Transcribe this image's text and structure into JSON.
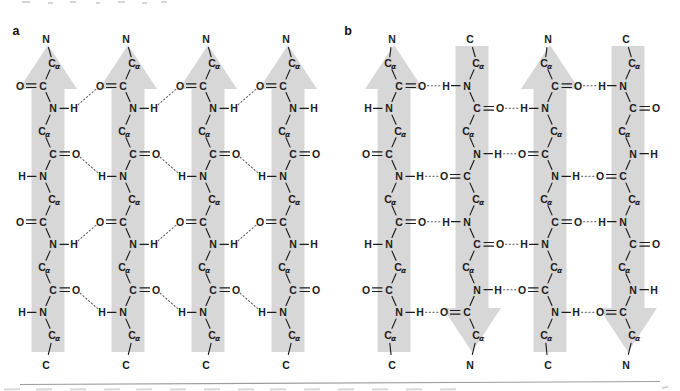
{
  "figure": {
    "alpha_subscript": "α",
    "colors": {
      "arrow": "#d7d7d7",
      "bond": "#1c1c1c",
      "text": "#1c1c1c",
      "hbond": "#5d5d5d",
      "rule": "#9c9c9c"
    },
    "panels": [
      {
        "label": "a",
        "label_x": 16,
        "strands": [
          {
            "cx": 48,
            "direction": "up",
            "top_label": "N",
            "bottom_label": "C",
            "rows": [
              "Ca",
              "C=O|L",
              "N-H|R",
              "Ca",
              "C=O|R",
              "N-H|L",
              "Ca",
              "C=O|L",
              "N-H|R",
              "Ca",
              "C=O|R",
              "N-H|L",
              "Ca"
            ]
          },
          {
            "cx": 128,
            "direction": "up",
            "top_label": "N",
            "bottom_label": "C",
            "rows": [
              "Ca",
              "C=O|L",
              "N-H|R",
              "Ca",
              "C=O|R",
              "N-H|L",
              "Ca",
              "C=O|L",
              "N-H|R",
              "Ca",
              "C=O|R",
              "N-H|L",
              "Ca"
            ]
          },
          {
            "cx": 208,
            "direction": "up",
            "top_label": "N",
            "bottom_label": "C",
            "rows": [
              "Ca",
              "C=O|L",
              "N-H|R",
              "Ca",
              "C=O|R",
              "N-H|L",
              "Ca",
              "C=O|L",
              "N-H|R",
              "Ca",
              "C=O|R",
              "N-H|L",
              "Ca"
            ]
          },
          {
            "cx": 288,
            "direction": "up",
            "top_label": "N",
            "bottom_label": "C",
            "rows": [
              "Ca",
              "C=O|L",
              "N-H|R",
              "Ca",
              "C=O|R",
              "N-H|L",
              "Ca",
              "C=O|L",
              "N-H|R",
              "Ca",
              "C=O|R",
              "N-H|L",
              "Ca"
            ]
          }
        ],
        "hbonds": [
          {
            "from": 0,
            "from_row": 2,
            "to": 1,
            "to_row": 1
          },
          {
            "from": 0,
            "from_row": 4,
            "to": 1,
            "to_row": 5
          },
          {
            "from": 0,
            "from_row": 8,
            "to": 1,
            "to_row": 7
          },
          {
            "from": 0,
            "from_row": 10,
            "to": 1,
            "to_row": 11
          },
          {
            "from": 1,
            "from_row": 2,
            "to": 2,
            "to_row": 1
          },
          {
            "from": 1,
            "from_row": 4,
            "to": 2,
            "to_row": 5
          },
          {
            "from": 1,
            "from_row": 8,
            "to": 2,
            "to_row": 7
          },
          {
            "from": 1,
            "from_row": 10,
            "to": 2,
            "to_row": 11
          },
          {
            "from": 2,
            "from_row": 2,
            "to": 3,
            "to_row": 1
          },
          {
            "from": 2,
            "from_row": 4,
            "to": 3,
            "to_row": 5
          },
          {
            "from": 2,
            "from_row": 8,
            "to": 3,
            "to_row": 7
          },
          {
            "from": 2,
            "from_row": 10,
            "to": 3,
            "to_row": 11
          }
        ]
      },
      {
        "label": "b",
        "label_x": 348,
        "strands": [
          {
            "cx": 394,
            "direction": "up",
            "top_label": "N",
            "bottom_label": "C",
            "rows": [
              "Ca",
              "C=O|R",
              "N-H|L",
              "Ca",
              "C=O|L",
              "N-H|R",
              "Ca",
              "C=O|R",
              "N-H|L",
              "Ca",
              "C=O|L",
              "N-H|R",
              "Ca"
            ]
          },
          {
            "cx": 472,
            "direction": "down",
            "top_label": "C",
            "bottom_label": "N",
            "rows": [
              "Ca",
              "N-H|L",
              "C=O|R",
              "Ca",
              "N-H|R",
              "C=O|L",
              "Ca",
              "N-H|L",
              "C=O|R",
              "Ca",
              "N-H|R",
              "C=O|L",
              "Ca"
            ]
          },
          {
            "cx": 550,
            "direction": "up",
            "top_label": "N",
            "bottom_label": "C",
            "rows": [
              "Ca",
              "C=O|R",
              "N-H|L",
              "Ca",
              "C=O|L",
              "N-H|R",
              "Ca",
              "C=O|R",
              "N-H|L",
              "Ca",
              "C=O|L",
              "N-H|R",
              "Ca"
            ]
          },
          {
            "cx": 628,
            "direction": "down",
            "top_label": "C",
            "bottom_label": "N",
            "rows": [
              "Ca",
              "N-H|L",
              "C=O|R",
              "Ca",
              "N-H|R",
              "C=O|L",
              "Ca",
              "N-H|L",
              "C=O|R",
              "Ca",
              "N-H|R",
              "C=O|L",
              "Ca"
            ]
          }
        ],
        "hbonds": [
          {
            "from": 0,
            "from_row": 1,
            "to": 1,
            "to_row": 1
          },
          {
            "from": 0,
            "from_row": 5,
            "to": 1,
            "to_row": 5
          },
          {
            "from": 0,
            "from_row": 7,
            "to": 1,
            "to_row": 7
          },
          {
            "from": 0,
            "from_row": 11,
            "to": 1,
            "to_row": 11
          },
          {
            "from": 1,
            "from_row": 2,
            "to": 2,
            "to_row": 2
          },
          {
            "from": 1,
            "from_row": 4,
            "to": 2,
            "to_row": 4
          },
          {
            "from": 1,
            "from_row": 8,
            "to": 2,
            "to_row": 8
          },
          {
            "from": 1,
            "from_row": 10,
            "to": 2,
            "to_row": 10
          },
          {
            "from": 2,
            "from_row": 1,
            "to": 3,
            "to_row": 1
          },
          {
            "from": 2,
            "from_row": 5,
            "to": 3,
            "to_row": 5
          },
          {
            "from": 2,
            "from_row": 7,
            "to": 3,
            "to_row": 7
          },
          {
            "from": 2,
            "from_row": 11,
            "to": 3,
            "to_row": 11
          }
        ]
      }
    ]
  }
}
